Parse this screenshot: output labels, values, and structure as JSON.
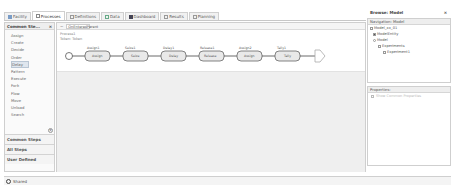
{
  "tabs": [
    {
      "label": "Facility",
      "icon": "facility-icon",
      "active": false
    },
    {
      "label": "Processes",
      "icon": "processes-icon",
      "active": true
    },
    {
      "label": "Definitions",
      "icon": "definitions-icon",
      "active": false
    },
    {
      "label": "Data",
      "icon": "data-icon",
      "active": false
    },
    {
      "label": "Dashboard",
      "icon": "dashboard-icon",
      "active": false
    },
    {
      "label": "Results",
      "icon": "results-icon",
      "active": false
    },
    {
      "label": "Planning",
      "icon": "planning-icon",
      "active": false
    }
  ],
  "left_panel": {
    "title": "Common Ste...",
    "close": "×",
    "items": [
      "Assign",
      "Create",
      "Decide",
      "Order",
      "Delay",
      "Pattern",
      "Execute",
      "Fork",
      "Flow",
      "Move",
      "Unload",
      "Search"
    ],
    "selected": "Delay",
    "sections": [
      "Common Steps",
      "All Steps",
      "User Defined"
    ]
  },
  "canvas": {
    "header_arrow": "−",
    "process_name": "OnEnteredParent",
    "meta_line1": "Process1",
    "meta_line2": "Token: Token",
    "begin_label": "Begin",
    "steps": [
      {
        "name": "Assign1",
        "type": "Assign"
      },
      {
        "name": "Seize1",
        "type": "Seize"
      },
      {
        "name": "Delay1",
        "type": "Delay"
      },
      {
        "name": "Release1",
        "type": "Release"
      },
      {
        "name": "Assign2",
        "type": "Assign"
      },
      {
        "name": "Tally1",
        "type": "Tally"
      }
    ],
    "end_label": "End"
  },
  "right_panel": {
    "title": "Browse: Model",
    "close": "×",
    "nav_title": "Navigation: Model",
    "tree": [
      {
        "label": "Model_xx_01",
        "indent": 0
      },
      {
        "label": "ModelEntity",
        "indent": 1
      },
      {
        "label": "Model",
        "indent": 1
      },
      {
        "label": "Experiments",
        "indent": 2
      },
      {
        "label": "Experiment1",
        "indent": 3
      }
    ],
    "props_title": "Properties:",
    "props_placeholder": "Show Common Properties"
  },
  "status": {
    "label": "Shared"
  }
}
